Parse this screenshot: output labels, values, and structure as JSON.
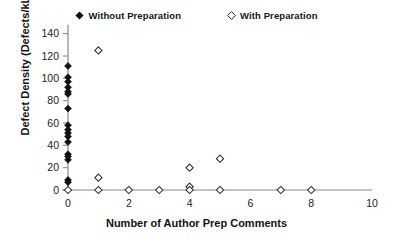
{
  "chart_data": {
    "type": "scatter",
    "title": "",
    "xlabel": "Number of Author Prep Comments",
    "ylabel": "Defect Density (Defects/kLOC)",
    "xlim": [
      0,
      10
    ],
    "ylim": [
      0,
      150
    ],
    "xticks": [
      "0",
      "2",
      "4",
      "6",
      "8",
      "10"
    ],
    "xtick_values": [
      0,
      2,
      4,
      6,
      8,
      10
    ],
    "yticks": [
      "0",
      "20",
      "40",
      "60",
      "80",
      "100",
      "120",
      "140"
    ],
    "ytick_values": [
      0,
      20,
      40,
      60,
      80,
      100,
      120,
      140
    ],
    "grid": false,
    "legend_position": "top-center",
    "series": [
      {
        "name": "Without Preparation",
        "marker": "filled-diamond",
        "color": "#111111",
        "points": [
          [
            0,
            111
          ],
          [
            0,
            101
          ],
          [
            0,
            97
          ],
          [
            0,
            92
          ],
          [
            0,
            88
          ],
          [
            0,
            86
          ],
          [
            0,
            73
          ],
          [
            0,
            58
          ],
          [
            0,
            54
          ],
          [
            0,
            51
          ],
          [
            0,
            48
          ],
          [
            0,
            43
          ],
          [
            0,
            32
          ],
          [
            0,
            30
          ],
          [
            0,
            27
          ],
          [
            0,
            9
          ],
          [
            0,
            7
          ]
        ]
      },
      {
        "name": "With Preparation",
        "marker": "open-diamond",
        "color": "#2a2a2a",
        "points": [
          [
            1,
            125
          ],
          [
            5,
            28
          ],
          [
            4,
            20
          ],
          [
            1,
            11
          ],
          [
            4,
            3
          ],
          [
            0,
            0
          ],
          [
            1,
            0
          ],
          [
            2,
            0
          ],
          [
            3,
            0
          ],
          [
            4,
            0
          ],
          [
            5,
            0
          ],
          [
            7,
            0
          ],
          [
            8,
            0
          ]
        ]
      }
    ]
  },
  "legend": {
    "entries": [
      {
        "label": "Without Preparation",
        "marker": "filled-diamond"
      },
      {
        "label": "With Preparation",
        "marker": "open-diamond"
      }
    ]
  },
  "axes": {
    "x_title": "Number of Author Prep Comments",
    "y_title": "Defect Density (Defects/kLOC)"
  }
}
